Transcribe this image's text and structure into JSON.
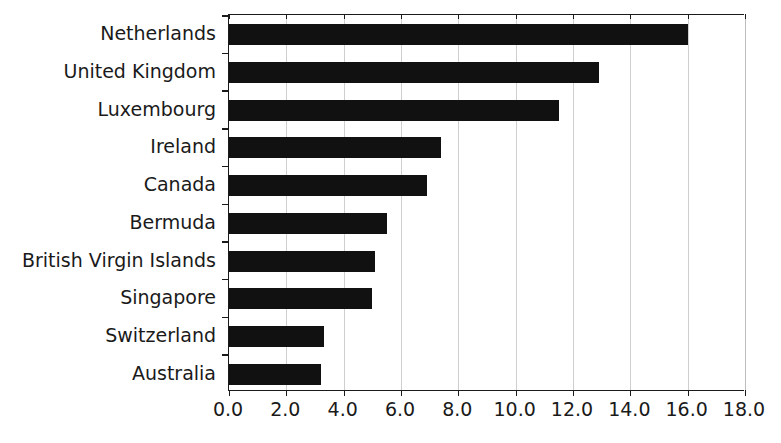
{
  "chart_data": {
    "type": "bar",
    "orientation": "horizontal",
    "title": "",
    "subtitle": "",
    "xlabel": "",
    "ylabel": "",
    "categories": [
      "Netherlands",
      "United Kingdom",
      "Luxembourg",
      "Ireland",
      "Canada",
      "Bermuda",
      "British Virgin Islands",
      "Singapore",
      "Switzerland",
      "Australia"
    ],
    "values": [
      16.0,
      12.9,
      11.5,
      7.4,
      6.9,
      5.5,
      5.1,
      5.0,
      3.3,
      3.2
    ],
    "xlim": [
      0.0,
      18.0
    ],
    "xticks": [
      0.0,
      2.0,
      4.0,
      6.0,
      8.0,
      10.0,
      12.0,
      14.0,
      16.0,
      18.0
    ],
    "xtick_labels": [
      "0.0",
      "2.0",
      "4.0",
      "6.0",
      "8.0",
      "10.0",
      "12.0",
      "14.0",
      "16.0",
      "18.0"
    ],
    "grid": "vertical",
    "legend": null,
    "bar_color": "#111111",
    "grid_color": "#cfcfcf",
    "axis_color": "#1a1a1a",
    "background_color": "#ffffff"
  }
}
